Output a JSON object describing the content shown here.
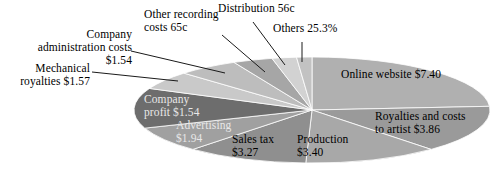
{
  "chart_data": {
    "type": "pie",
    "title": "",
    "subtitle": "",
    "xlabel": "",
    "ylabel": "",
    "legend_position": "none",
    "grid": false,
    "units": "currency_and_percent",
    "categories": [
      "Online website",
      "Royalties and costs to artist",
      "Production",
      "Sales tax",
      "Advertising",
      "Company profit",
      "Mechanical royalties",
      "Company administration costs",
      "Other recording costs",
      "Distribution",
      "Others"
    ],
    "values": [
      7.4,
      3.86,
      3.4,
      3.27,
      1.94,
      1.54,
      1.57,
      1.54,
      0.65,
      0.56,
      0.0
    ],
    "value_labels": [
      "$7.40",
      "$3.86",
      "$3.40",
      "$3.27",
      "$1.94",
      "$1.54",
      "$1.57",
      "$1.54",
      "65c",
      "56c",
      "25.3%"
    ],
    "slice_colors": [
      "#b0b0b0",
      "#9a9a9a",
      "#a8a8a8",
      "#8f8f8f",
      "#a0a0a0",
      "#6d6d6d",
      "#c9c9c9",
      "#bdbdbd",
      "#a6a6a6",
      "#d2d2d2",
      "#c2c2c2"
    ]
  },
  "figure": {
    "background_color": "#ffffff",
    "line_color": "#1a1a1a",
    "slice_edge_color": "#ffffff"
  },
  "callouts": [
    {
      "name": "company-administration-costs",
      "text": "Company\nadministration costs $1.54"
    },
    {
      "name": "mechanical-royalties",
      "text": "Mechanical\nroyalties $1.57"
    },
    {
      "name": "other-recording-costs",
      "text": "Other recording\ncosts 65c"
    },
    {
      "name": "distribution",
      "text": "Distribution 56c"
    },
    {
      "name": "others",
      "text": "Others 25.3%"
    }
  ],
  "slice_labels": [
    {
      "name": "online-website",
      "text": "Online website $7.40"
    },
    {
      "name": "royalties-and-costs-to-artist",
      "text": "Royalties and costs\nto artist $3.86"
    },
    {
      "name": "production",
      "text": "Production\n$3.40"
    },
    {
      "name": "sales-tax",
      "text": "Sales tax\n$3.27"
    },
    {
      "name": "advertising",
      "text": "Advertising\n$1.94"
    },
    {
      "name": "company-profit",
      "text": "Company\nprofit $1.54"
    }
  ]
}
